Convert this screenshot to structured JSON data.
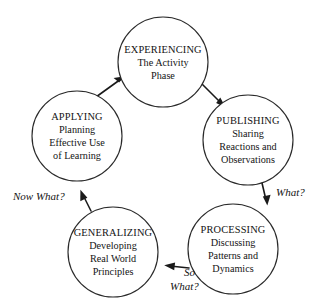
{
  "diagram": {
    "background_color": "#ffffff",
    "line_color": "#1a1a1a",
    "text_color": "#141414",
    "nodes": [
      {
        "id": "experiencing",
        "title": "EXPERIENCING",
        "lines": [
          "The Activity",
          "Phase"
        ],
        "cx": 163,
        "cy": 62,
        "r": 45
      },
      {
        "id": "publishing",
        "title": "PUBLISHING",
        "lines": [
          "Sharing",
          "Reactions and",
          "Observations"
        ],
        "cx": 248,
        "cy": 140,
        "r": 45
      },
      {
        "id": "processing",
        "title": "PROCESSING",
        "lines": [
          "Discussing",
          "Patterns and",
          "Dynamics"
        ],
        "cx": 233,
        "cy": 249,
        "r": 45
      },
      {
        "id": "generalizing",
        "title": "GENERALIZING",
        "lines": [
          "Developing",
          "Real World",
          "Principles"
        ],
        "cx": 113,
        "cy": 252,
        "r": 45
      },
      {
        "id": "applying",
        "title": "APPLYING",
        "lines": [
          "Planning",
          "Effective Use",
          "of Learning"
        ],
        "cx": 77,
        "cy": 136,
        "r": 45
      }
    ],
    "edge_labels": [
      {
        "id": "what",
        "lines": [
          "What?"
        ],
        "x": 276,
        "y": 196
      },
      {
        "id": "so-what",
        "lines": [
          "So",
          "What?"
        ],
        "x": 178,
        "y": 276
      },
      {
        "id": "now-what",
        "lines": [
          "Now What?"
        ],
        "x": 13,
        "y": 200
      }
    ],
    "edges": [
      {
        "id": "experiencing-to-publishing",
        "from": "experiencing",
        "to": "publishing"
      },
      {
        "id": "publishing-to-processing",
        "from": "publishing",
        "to": "processing",
        "label": "what"
      },
      {
        "id": "processing-to-generalizing",
        "from": "processing",
        "to": "generalizing",
        "label": "so-what"
      },
      {
        "id": "generalizing-to-applying",
        "from": "generalizing",
        "to": "applying",
        "label": "now-what"
      },
      {
        "id": "applying-to-experiencing",
        "from": "applying",
        "to": "experiencing"
      }
    ]
  }
}
